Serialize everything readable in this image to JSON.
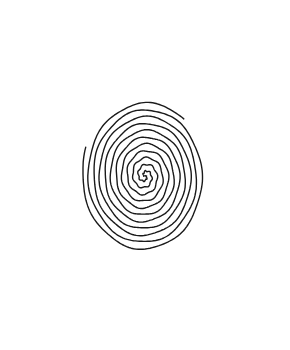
{
  "image": {
    "description": "Black line drawing of a double-armed spiral on a white background",
    "background_color": "#ffffff",
    "line_color": "#1a1a1a",
    "arms": [
      {
        "name": "arm-a",
        "turns": 5.6,
        "start_angle_deg": 0
      },
      {
        "name": "arm-b",
        "turns": 5.4,
        "start_angle_deg": 180
      }
    ],
    "rotation": "clockwise-outward"
  }
}
